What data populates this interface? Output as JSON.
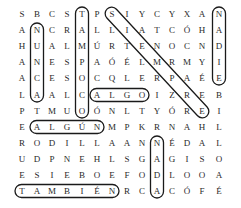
{
  "puzzle": {
    "type": "word-search",
    "columns": 14,
    "rows": [
      "SBCSTPSIYCYXAN",
      "ANCRALLIATCÓHA",
      "HUALMÚRTENOCND",
      "ANESPAÓÉLMRMYI",
      "ACESOCQLERPAÉE",
      "LAALCALGOIZREB",
      "PTMUOÓNLTYÓREI",
      "EALGÚNMPKRNAHL",
      "RODILLAANNÉDAL",
      "UDPNEHLSGAGISO",
      "ESIEBOEFODLOOA",
      "TAMBIÉNRCACÓFÉ"
    ],
    "found_words": [
      {
        "word": "NUNCA",
        "start": [
          1,
          1
        ],
        "end": [
          5,
          1
        ],
        "direction": "vertical"
      },
      {
        "word": "TAMPOCO",
        "start": [
          0,
          4
        ],
        "end": [
          6,
          4
        ],
        "direction": "vertical"
      },
      {
        "word": "SIEMPRE",
        "start": [
          0,
          6
        ],
        "end": [
          6,
          12
        ],
        "direction": "diagonal"
      },
      {
        "word": "NADIE",
        "start": [
          0,
          13
        ],
        "end": [
          4,
          13
        ],
        "direction": "vertical"
      },
      {
        "word": "ALGO",
        "start": [
          5,
          5
        ],
        "end": [
          5,
          8
        ],
        "direction": "horizontal"
      },
      {
        "word": "ALGÚN",
        "start": [
          7,
          1
        ],
        "end": [
          7,
          5
        ],
        "direction": "horizontal"
      },
      {
        "word": "NADA",
        "start": [
          8,
          9
        ],
        "end": [
          11,
          9
        ],
        "direction": "vertical"
      },
      {
        "word": "TAMBIÉN",
        "start": [
          11,
          0
        ],
        "end": [
          11,
          6
        ],
        "direction": "horizontal"
      }
    ]
  },
  "layout": {
    "col_x": [
      22,
      37,
      52,
      67,
      82,
      97,
      112,
      127,
      142,
      157,
      172,
      187,
      202,
      219
    ],
    "row_y": [
      14,
      30,
      46,
      62,
      78,
      95,
      111,
      127,
      143,
      159,
      175,
      191
    ]
  }
}
